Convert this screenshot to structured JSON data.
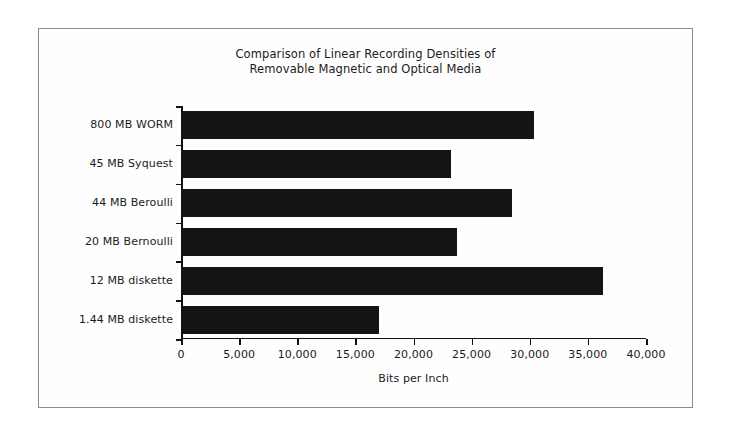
{
  "chart_data": {
    "type": "bar",
    "orientation": "horizontal",
    "title": "Comparison of Linear Recording Densities of Removable Magnetic and Optical Media",
    "title_lines": [
      "Comparison of Linear Recording Densities of",
      "Removable Magnetic and Optical Media"
    ],
    "xlabel": "Bits per Inch",
    "ylabel": "",
    "categories": [
      "800 MB WORM",
      "45 MB Syquest",
      "44 MB Beroulli",
      "20 MB Bernoulli",
      "12 MB diskette",
      "1.44 MB diskette"
    ],
    "values": [
      30400,
      23200,
      28500,
      23700,
      36300,
      17000
    ],
    "xlim": [
      0,
      40000
    ],
    "xticks": [
      0,
      5000,
      10000,
      15000,
      20000,
      25000,
      30000,
      35000,
      40000
    ],
    "xtick_labels": [
      "0",
      "5,000",
      "10,000",
      "15,000",
      "20,000",
      "25,000",
      "30,000",
      "35,000",
      "40,000"
    ],
    "grid": false,
    "legend": false,
    "bar_color": "#141414",
    "axis_color": "#121212",
    "text_color": "#1b1b1b",
    "background_color": "#fefefe",
    "frame_color": "#8b8b8b"
  }
}
